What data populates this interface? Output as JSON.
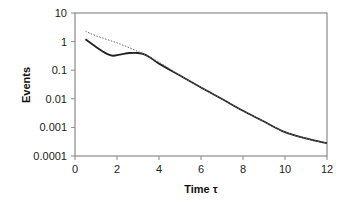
{
  "chart_data": {
    "type": "line",
    "title": "",
    "xlabel": "Time τ",
    "ylabel": "Events",
    "xlim": [
      0,
      12
    ],
    "ylim": [
      0.0001,
      10
    ],
    "yscale": "log",
    "grid": false,
    "legend": null,
    "x_ticks": [
      "0",
      "2",
      "4",
      "6",
      "8",
      "10",
      "12"
    ],
    "y_ticks": [
      "10",
      "1",
      "0.1",
      "0.01",
      "0.001",
      "0.0001"
    ],
    "series": [
      {
        "name": "solid",
        "style": "solid",
        "color": "#222222",
        "x": [
          0.5,
          1.0,
          1.5,
          1.8,
          2.2,
          2.6,
          3.0,
          3.3,
          3.6,
          4.0,
          5,
          6,
          7,
          8,
          9,
          10,
          11,
          12
        ],
        "y": [
          1.2,
          0.65,
          0.38,
          0.32,
          0.36,
          0.4,
          0.4,
          0.36,
          0.27,
          0.17,
          0.065,
          0.025,
          0.0098,
          0.0038,
          0.0016,
          0.00068,
          0.00041,
          0.00028
        ]
      },
      {
        "name": "dotted",
        "style": "dotted",
        "color": "#666666",
        "x": [
          0.5,
          1,
          2,
          3,
          4,
          5,
          6,
          7,
          8,
          9,
          10,
          11,
          12
        ],
        "y": [
          2.3,
          1.6,
          0.9,
          0.45,
          0.19,
          0.065,
          0.025,
          0.0098,
          0.0038,
          0.0016,
          0.00068,
          0.00041,
          0.00028
        ]
      }
    ]
  },
  "axes": {
    "x_title": "Time τ",
    "y_title": "Events"
  }
}
